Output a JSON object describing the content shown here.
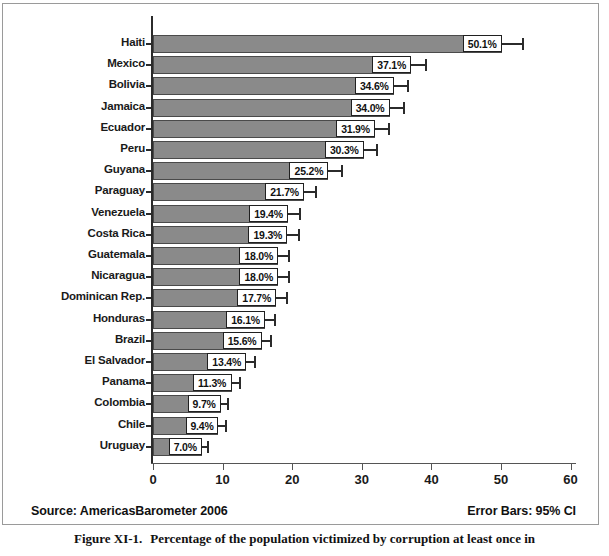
{
  "figure": {
    "caption_number": "Figure XI-1.",
    "caption_text": "Percentage of the population victimized by corruption at least once in",
    "source_note": "Source: AmericasBarometer  2006",
    "errorbar_note": "Error Bars: 95% CI"
  },
  "chart_data": {
    "type": "bar",
    "orientation": "horizontal",
    "title": "",
    "xlabel": "",
    "ylabel": "",
    "xlim": [
      0,
      60
    ],
    "xticks": [
      0,
      10,
      20,
      30,
      40,
      50,
      60
    ],
    "xtick_labels": [
      "0",
      "10",
      "20",
      "30",
      "40",
      "50",
      "60"
    ],
    "grid": false,
    "legend": "none",
    "error_bar_type": "95% CI",
    "bar_color": "#8a8a8a",
    "bar_edge_color": "#4a4a4a",
    "label_box_color": "#ffffff",
    "categories": [
      "Haiti",
      "Mexico",
      "Bolivia",
      "Jamaica",
      "Ecuador",
      "Peru",
      "Guyana",
      "Paraguay",
      "Venezuela",
      "Costa Rica",
      "Guatemala",
      "Nicaragua",
      "Dominican Rep.",
      "Honduras",
      "Brazil",
      "El Salvador",
      "Panama",
      "Colombia",
      "Chile",
      "Uruguay"
    ],
    "values": [
      50.1,
      37.1,
      34.6,
      34.0,
      31.9,
      30.3,
      25.2,
      21.7,
      19.4,
      19.3,
      18.0,
      18.0,
      17.7,
      16.1,
      15.6,
      13.4,
      11.3,
      9.7,
      9.4,
      7.0
    ],
    "value_labels": [
      "50.1%",
      "37.1%",
      "34.6%",
      "34.0%",
      "31.9%",
      "30.3%",
      "25.2%",
      "21.7%",
      "19.4%",
      "19.3%",
      "18.0%",
      "18.0%",
      "17.7%",
      "16.1%",
      "15.6%",
      "13.4%",
      "11.3%",
      "9.7%",
      "9.4%",
      "7.0%"
    ],
    "ci_low": [
      47.0,
      35.0,
      32.5,
      31.9,
      29.9,
      28.4,
      23.2,
      20.0,
      17.7,
      17.6,
      16.4,
      16.4,
      16.1,
      14.6,
      14.2,
      12.1,
      10.1,
      8.6,
      8.3,
      6.1
    ],
    "ci_high": [
      53.2,
      39.2,
      36.7,
      36.1,
      33.9,
      32.2,
      27.2,
      23.4,
      21.1,
      21.0,
      19.6,
      19.6,
      19.3,
      17.6,
      17.0,
      14.7,
      12.5,
      10.8,
      10.5,
      7.9
    ]
  }
}
